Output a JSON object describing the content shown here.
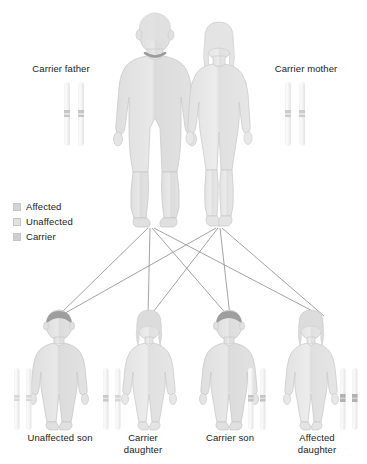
{
  "diagram": {
    "title_hidden": "",
    "type": "autosomal recessive inheritance pedigree",
    "background_color": "#ffffff"
  },
  "parents": [
    {
      "id": "father",
      "label": "Carrier father",
      "sex": "male",
      "status": "carrier",
      "body_fill": "#e3e3e3",
      "body_stroke": "#c9c9c9",
      "hair_fill": "#e0e0e0",
      "chromosomes": [
        {
          "band_color": "#bdbdbd",
          "band_state": "mutant"
        },
        {
          "band_color": "#bdbdbd",
          "band_state": "mutant"
        }
      ]
    },
    {
      "id": "mother",
      "label": "Carrier mother",
      "sex": "female",
      "status": "carrier",
      "body_fill": "#e6e6e6",
      "body_stroke": "#cccccc",
      "hair_fill": "#e4e4e4",
      "chromosomes": [
        {
          "band_color": "#c4c4c4",
          "band_state": "mutant"
        },
        {
          "band_color": "#c4c4c4",
          "band_state": "mutant"
        }
      ]
    }
  ],
  "children": [
    {
      "id": "child1",
      "label": "Unaffected son",
      "sex": "male",
      "status": "unaffected",
      "hair_fill": "#9e9e9e",
      "body_fill": "#e2e2e2",
      "chromosomes": [
        {
          "band_color": "#cfcfcf",
          "band_state": "normal"
        },
        {
          "band_color": "#cfcfcf",
          "band_state": "normal"
        }
      ]
    },
    {
      "id": "child2",
      "label": "Carrier\ndaughter",
      "sex": "female",
      "status": "carrier",
      "hair_fill": "#dcdcdc",
      "body_fill": "#e6e6e6",
      "chromosomes": [
        {
          "band_color": "#bfbfbf",
          "band_state": "mutant"
        },
        {
          "band_color": "#cfcfcf",
          "band_state": "normal"
        }
      ]
    },
    {
      "id": "child3",
      "label": "Carrier son",
      "sex": "male",
      "status": "carrier",
      "hair_fill": "#9e9e9e",
      "body_fill": "#e2e2e2",
      "chromosomes": [
        {
          "band_color": "#bababa",
          "band_state": "mutant"
        },
        {
          "band_color": "#bababa",
          "band_state": "mutant"
        }
      ]
    },
    {
      "id": "child4",
      "label": "Affected\ndaughter",
      "sex": "female",
      "status": "affected",
      "hair_fill": "#dcdcdc",
      "body_fill": "#e6e6e6",
      "chromosomes": [
        {
          "band_color": "#a8a8a8",
          "band_state": "mutant"
        },
        {
          "band_color": "#a8a8a8",
          "band_state": "mutant"
        }
      ]
    }
  ],
  "legend": {
    "items": [
      {
        "label": "Affected",
        "swatch_color": "#d4d4d4"
      },
      {
        "label": "Unaffected",
        "swatch_color": "#e2e2e2"
      },
      {
        "label": "Carrier",
        "swatch_color": "#cfcfcf"
      }
    ]
  },
  "inheritance_lines": {
    "stroke_color": "#8c8c8c",
    "description": "each parent connects to all four children",
    "count": 8
  }
}
